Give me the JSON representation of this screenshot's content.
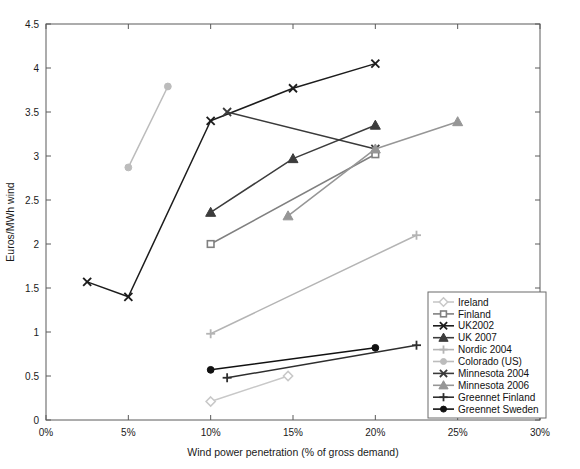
{
  "chart_data": {
    "type": "line",
    "title": "",
    "xlabel": "Wind power penetration (% of gross demand)",
    "ylabel": "Euros/MWh wind",
    "xlim": [
      0,
      30
    ],
    "ylim": [
      0,
      4.5
    ],
    "xticks": [
      0,
      5,
      10,
      15,
      20,
      25,
      30
    ],
    "xticklabels": [
      "0%",
      "5%",
      "10%",
      "15%",
      "20%",
      "25%",
      "30%"
    ],
    "yticks": [
      0,
      0.5,
      1,
      1.5,
      2,
      2.5,
      3,
      3.5,
      4,
      4.5
    ],
    "yticklabels": [
      "0",
      "0.5",
      "1",
      "1.5",
      "2",
      "2.5",
      "3",
      "3.5",
      "4",
      "4.5"
    ],
    "grid": false,
    "legend_position": "lower right",
    "series": [
      {
        "name": "Ireland",
        "color": "#c8c8c8",
        "marker": "diamond",
        "x": [
          10.0,
          14.7
        ],
        "y": [
          0.21,
          0.5
        ]
      },
      {
        "name": "Finland",
        "color": "#808080",
        "marker": "square",
        "x": [
          10.0,
          20.0
        ],
        "y": [
          2.0,
          3.02
        ]
      },
      {
        "name": "UK2002",
        "color": "#1c1c1c",
        "marker": "x",
        "x": [
          2.5,
          5.0,
          10.0,
          15.0,
          20.0
        ],
        "y": [
          1.57,
          1.4,
          3.4,
          3.77,
          4.05
        ]
      },
      {
        "name": "UK 2007",
        "color": "#3c3c3c",
        "marker": "triangle",
        "x": [
          10.0,
          15.0,
          20.0
        ],
        "y": [
          2.36,
          2.97,
          3.35
        ]
      },
      {
        "name": "Nordic 2004",
        "color": "#b4b4b4",
        "marker": "plus",
        "x": [
          10.0,
          22.5
        ],
        "y": [
          0.98,
          2.1
        ]
      },
      {
        "name": "Colorado (US)",
        "color": "#bcbcbc",
        "marker": "circle",
        "x": [
          5.0,
          7.4
        ],
        "y": [
          2.87,
          3.79
        ]
      },
      {
        "name": "Minnesota 2004",
        "color": "#3a3a3a",
        "marker": "x",
        "x": [
          11.0,
          20.0
        ],
        "y": [
          3.5,
          3.08
        ]
      },
      {
        "name": "Minnesota 2006",
        "color": "#969696",
        "marker": "triangle",
        "x": [
          14.7,
          20.0,
          25.0
        ],
        "y": [
          2.32,
          3.08,
          3.39
        ]
      },
      {
        "name": "Greennet Finland",
        "color": "#2e2e2e",
        "marker": "plus",
        "x": [
          11.0,
          22.5
        ],
        "y": [
          0.48,
          0.85
        ]
      },
      {
        "name": "Greennet Sweden",
        "color": "#111111",
        "marker": "circle",
        "x": [
          10.0,
          20.0
        ],
        "y": [
          0.57,
          0.82
        ]
      }
    ]
  }
}
